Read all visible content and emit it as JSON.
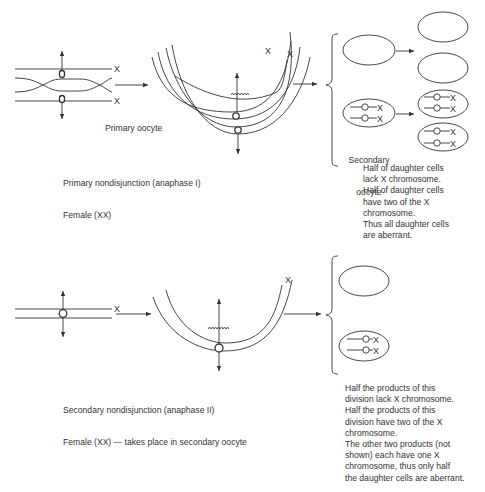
{
  "panels": [
    {
      "id": "primary",
      "marker_label": "X",
      "cell_label": "Primary oocyte",
      "caption": [
        "Primary nondisjunction (anaphase I)",
        "Female (XX)"
      ],
      "daughter_label": [
        "Secondary",
        "oocyte"
      ],
      "note": [
        "Half of daughter cells",
        "lack X chromosome.",
        "Half of daughter cells",
        "have two of the X",
        "chromosome.",
        "Thus all daughter cells",
        "are aberrant."
      ]
    },
    {
      "id": "secondary",
      "marker_label": "X",
      "caption": [
        "Secondary nondisjunction (anaphase II)",
        "Female (XX) — takes place in secondary oocyte"
      ],
      "note": [
        "Half the products of this",
        "division lack X chromosome.",
        "Half the products of this",
        "division have two of the X",
        "chromosome.",
        "The other two products (not",
        "shown) each have one X",
        "chromosome, thus only half",
        "the daughter cells are aberrant."
      ]
    }
  ]
}
